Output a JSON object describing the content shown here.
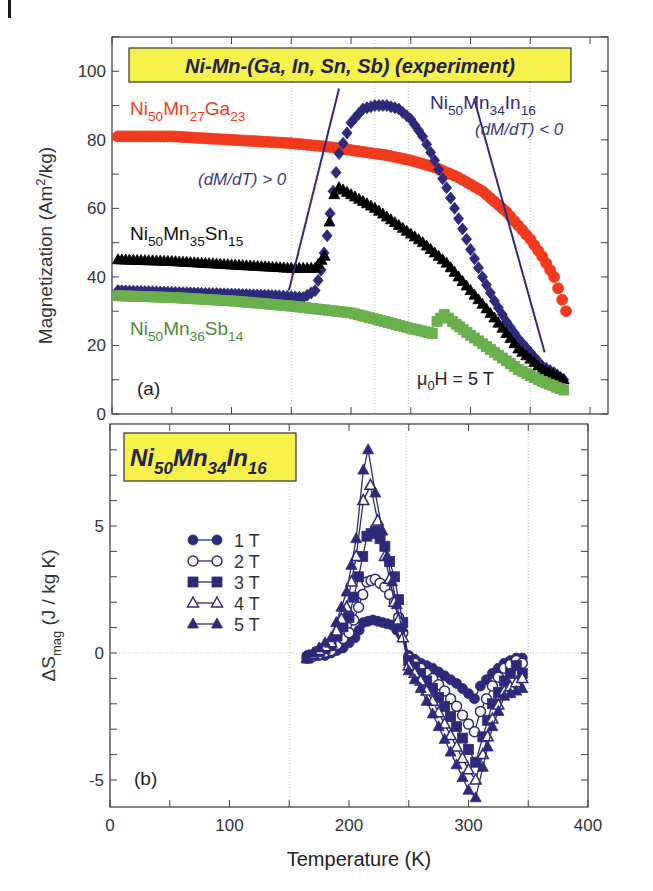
{
  "figure": {
    "corner_mark": true
  },
  "chart_data": [
    {
      "panel": "(a)",
      "type": "scatter",
      "title": "Ni-Mn-(Ga, In, Sn, Sb)  (experiment)",
      "xlabel": "Temperature (K)",
      "ylabel": "Magnetization (Am²/kg)",
      "ylabel_main": "Magnetization (Am",
      "ylabel_sup": "2",
      "ylabel_tail": "/kg)",
      "xlim": [
        0,
        400
      ],
      "ylim": [
        0,
        110
      ],
      "xticks": [
        0,
        100,
        200,
        300,
        400
      ],
      "yticks": [
        0,
        20,
        40,
        60,
        80,
        100
      ],
      "ytick_labels": [
        "0",
        "20",
        "40",
        "60",
        "80",
        "100"
      ],
      "field_annotation": {
        "prefix": "μ",
        "sub": "0",
        "suffix": "H = 5 T"
      },
      "annotations": [
        {
          "text": "(dM/dT) > 0",
          "x": 105,
          "y": 67
        },
        {
          "text": "(dM/dT) < 0",
          "x": 290,
          "y": 77
        }
      ],
      "vertical_guides": [
        150,
        220,
        248,
        350
      ],
      "series": [
        {
          "name": "Ni50Mn27Ga23",
          "label": {
            "parts": [
              [
                "Ni",
                ""
              ],
              [
                "50",
                "sub"
              ],
              [
                "Mn",
                ""
              ],
              [
                "27",
                "sub"
              ],
              [
                "Ga",
                ""
              ],
              [
                "23",
                "sub"
              ]
            ]
          },
          "color": "#f03a1e",
          "marker": "circle",
          "x": [
            5,
            50,
            100,
            150,
            180,
            200,
            230,
            250,
            270,
            290,
            310,
            330,
            350,
            360,
            370,
            380
          ],
          "y": [
            81,
            81,
            80,
            79,
            78,
            77,
            75.5,
            74,
            72,
            69,
            65,
            59,
            51,
            46,
            40,
            30
          ]
        },
        {
          "name": "Ni50Mn34In16",
          "label": {
            "parts": [
              [
                "Ni",
                ""
              ],
              [
                "50",
                "sub"
              ],
              [
                "Mn",
                ""
              ],
              [
                "34",
                "sub"
              ],
              [
                "In",
                ""
              ],
              [
                "16",
                "sub"
              ]
            ]
          },
          "color": "#2e2a7a",
          "marker": "diamond",
          "x": [
            5,
            50,
            100,
            140,
            160,
            170,
            175,
            180,
            185,
            190,
            200,
            210,
            220,
            230,
            240,
            250,
            260,
            270,
            280,
            290,
            300,
            310,
            320,
            330,
            340,
            350,
            360,
            370,
            378
          ],
          "y": [
            36,
            35.5,
            35,
            34.5,
            34,
            36,
            42,
            52,
            65,
            76,
            85,
            89,
            90,
            90,
            89,
            86,
            81,
            74,
            66,
            57,
            48,
            40,
            33,
            27,
            22,
            18,
            14,
            12,
            10
          ]
        },
        {
          "name": "Ni50Mn35Sn15",
          "label": {
            "parts": [
              [
                "Ni",
                ""
              ],
              [
                "50",
                "sub"
              ],
              [
                "Mn",
                ""
              ],
              [
                "35",
                "sub"
              ],
              [
                "Sn",
                ""
              ],
              [
                "15",
                "sub"
              ]
            ]
          },
          "color": "#000000",
          "marker": "triangle",
          "x": [
            5,
            50,
            100,
            150,
            170,
            178,
            182,
            186,
            190,
            200,
            220,
            240,
            260,
            280,
            300,
            320,
            340,
            360,
            378
          ],
          "y": [
            45,
            44.5,
            43.5,
            42.5,
            42.5,
            46,
            56,
            64,
            66,
            64,
            60,
            55,
            50,
            44,
            36,
            28,
            19,
            13,
            10
          ]
        },
        {
          "name": "Ni50Mn36Sb14",
          "label": {
            "parts": [
              [
                "Ni",
                ""
              ],
              [
                "50",
                "sub"
              ],
              [
                "Mn",
                ""
              ],
              [
                "36",
                "sub"
              ],
              [
                "Sb",
                ""
              ],
              [
                "14",
                "sub"
              ]
            ]
          },
          "color": "#6ab04c",
          "marker": "square",
          "x": [
            5,
            50,
            100,
            150,
            200,
            250,
            268,
            272,
            278,
            285,
            300,
            320,
            340,
            360,
            378
          ],
          "y": [
            34.5,
            34,
            33,
            31.5,
            29.5,
            25,
            23.5,
            27,
            29,
            27,
            23,
            18,
            13,
            9.5,
            7
          ]
        }
      ],
      "slope_lines": [
        {
          "x1": 148,
          "y1": 36,
          "x2": 190,
          "y2": 95
        },
        {
          "x1": 303,
          "y1": 92,
          "x2": 362,
          "y2": 18
        }
      ]
    },
    {
      "panel": "(b)",
      "type": "line",
      "title": "Ni50Mn34In16",
      "title_parts": [
        [
          "Ni",
          ""
        ],
        [
          "50",
          "sub"
        ],
        [
          "Mn",
          ""
        ],
        [
          "34",
          "sub"
        ],
        [
          "In",
          ""
        ],
        [
          "16",
          "sub"
        ]
      ],
      "xlabel": "Temperature (K)",
      "ylabel": "ΔS_mag (J / kg K)",
      "ylabel_main": "ΔS",
      "ylabel_sub": "mag",
      "ylabel_tail": " (J / kg K)",
      "xlim": [
        0,
        400
      ],
      "ylim": [
        -6,
        9
      ],
      "xticks": [
        0,
        100,
        200,
        300,
        400
      ],
      "xtick_labels": [
        "0",
        "100",
        "200",
        "300",
        "400"
      ],
      "yticks": [
        -5,
        0,
        5
      ],
      "ytick_labels": [
        "-5",
        "0",
        "5"
      ],
      "vertical_guides": [
        150,
        248,
        350
      ],
      "color": "#2e2a7a",
      "legend": [
        {
          "label": "1 T",
          "marker": "circle",
          "filled": true
        },
        {
          "label": "2 T",
          "marker": "circle",
          "filled": false
        },
        {
          "label": "3 T",
          "marker": "square",
          "filled": true
        },
        {
          "label": "4 T",
          "marker": "triangle",
          "filled": false
        },
        {
          "label": "5 T",
          "marker": "triangle",
          "filled": true
        }
      ],
      "series": [
        {
          "name": "1 T",
          "marker": "circle",
          "filled": true,
          "x": [
            165,
            180,
            195,
            205,
            212,
            220,
            228,
            236,
            244,
            250,
            260,
            270,
            280,
            290,
            300,
            305,
            310,
            320,
            330,
            340,
            345
          ],
          "y": [
            -0.1,
            -0.1,
            0.2,
            0.6,
            1.2,
            1.3,
            1.2,
            1.1,
            0.7,
            -0.1,
            -0.4,
            -0.6,
            -0.9,
            -1.2,
            -1.6,
            -1.8,
            -1.3,
            -0.8,
            -0.4,
            -0.2,
            -0.2
          ]
        },
        {
          "name": "2 T",
          "marker": "circle",
          "filled": false,
          "x": [
            165,
            185,
            200,
            208,
            215,
            222,
            230,
            238,
            245,
            250,
            260,
            270,
            280,
            290,
            300,
            305,
            310,
            320,
            330,
            340,
            345
          ],
          "y": [
            -0.2,
            0.1,
            0.8,
            1.8,
            2.8,
            2.9,
            2.6,
            2.0,
            0.8,
            -0.2,
            -0.6,
            -1.0,
            -1.5,
            -2.1,
            -2.8,
            -3.1,
            -2.3,
            -1.3,
            -0.6,
            -0.3,
            -0.4
          ]
        },
        {
          "name": "3 T",
          "marker": "square",
          "filled": true,
          "x": [
            165,
            185,
            200,
            208,
            215,
            222,
            230,
            238,
            245,
            250,
            260,
            270,
            280,
            290,
            300,
            306,
            312,
            320,
            330,
            340,
            345
          ],
          "y": [
            -0.2,
            0.3,
            1.4,
            3.0,
            4.6,
            4.8,
            4.2,
            3.0,
            1.2,
            -0.3,
            -0.8,
            -1.4,
            -2.1,
            -2.9,
            -3.8,
            -4.3,
            -3.3,
            -2.0,
            -1.1,
            -0.5,
            -0.8
          ]
        },
        {
          "name": "4 T",
          "marker": "triangle",
          "filled": false,
          "x": [
            165,
            185,
            198,
            206,
            212,
            218,
            224,
            230,
            238,
            245,
            250,
            260,
            270,
            280,
            290,
            300,
            306,
            312,
            320,
            330,
            345
          ],
          "y": [
            -0.2,
            0.4,
            1.8,
            3.8,
            6.0,
            6.6,
            5.2,
            3.8,
            2.0,
            0.6,
            -0.5,
            -1.1,
            -1.9,
            -2.8,
            -3.7,
            -4.6,
            -5.0,
            -4.0,
            -2.6,
            -1.5,
            -1.0
          ]
        },
        {
          "name": "5 T",
          "marker": "triangle",
          "filled": true,
          "x": [
            165,
            185,
            198,
            206,
            212,
            216,
            222,
            228,
            236,
            244,
            250,
            260,
            270,
            280,
            290,
            300,
            306,
            312,
            320,
            330,
            345
          ],
          "y": [
            -0.2,
            0.6,
            2.4,
            4.5,
            7.2,
            8.0,
            6.3,
            4.8,
            2.8,
            1.0,
            -0.7,
            -1.4,
            -2.4,
            -3.4,
            -4.4,
            -5.4,
            -5.7,
            -4.5,
            -2.9,
            -1.7,
            -1.4
          ]
        }
      ]
    }
  ]
}
